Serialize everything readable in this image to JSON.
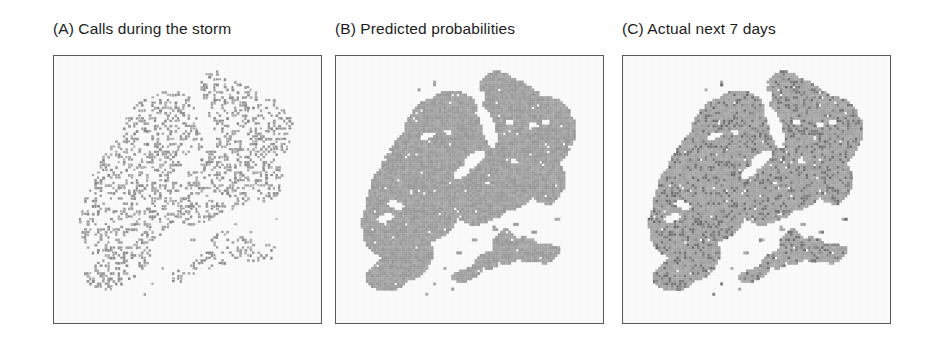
{
  "figure": {
    "kind": "multi-panel-map-figure",
    "width": 935,
    "height": 342,
    "background_color": "#ffffff",
    "frame_border_color": "#5a5a5a",
    "panel_count": 3
  },
  "panels": [
    {
      "id": "A",
      "label": "(A) Calls during the storm",
      "render_style": "sparse-dots",
      "base_fill": "#ffffff",
      "dot_color": "#9a9a9a",
      "dot_density": 0.34,
      "x": 53,
      "y": 55,
      "width": 269,
      "height": 269
    },
    {
      "id": "B",
      "label": "(B) Predicted probabilities",
      "render_style": "solid-choropleth",
      "base_fill": "#a7a7a7",
      "dot_color": "#9b9b9b",
      "dot_density": 0.0,
      "x": 335,
      "y": 55,
      "width": 269,
      "height": 269
    },
    {
      "id": "C",
      "label": "(C) Actual next 7 days",
      "render_style": "choropleth-with-speckle",
      "base_fill": "#acacac",
      "dot_color": "#7b7b7b",
      "dot_density": 0.22,
      "x": 622,
      "y": 55,
      "width": 269,
      "height": 269
    }
  ],
  "chart_data": {
    "type": "heatmap",
    "title": "",
    "xlabel": "",
    "ylabel": "",
    "grid": true,
    "legend_position": "none",
    "grid_cells_x": 96,
    "grid_cells_y": 96,
    "panels": [
      {
        "id": "A",
        "name": "(A) Calls during the storm",
        "encoding": "point-density",
        "value_range": [
          0,
          1
        ],
        "fill_fraction": 0.34,
        "colors": [
          "#ffffff",
          "#9a9a9a"
        ]
      },
      {
        "id": "B",
        "name": "(B) Predicted probabilities",
        "encoding": "continuous-gray-shading",
        "value_range": [
          0,
          1
        ],
        "fill_fraction": 1.0,
        "colors": [
          "#ffffff",
          "#a7a7a7"
        ]
      },
      {
        "id": "C",
        "name": "(C) Actual next 7 days",
        "encoding": "binary-event-overlay",
        "value_range": [
          0,
          1
        ],
        "fill_fraction": 0.22,
        "colors": [
          "#acacac",
          "#7b7b7b"
        ]
      }
    ]
  }
}
